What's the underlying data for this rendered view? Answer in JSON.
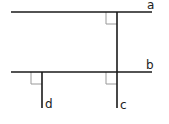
{
  "diagram": {
    "title": "",
    "colors": {
      "line": "#1a1a1a",
      "marker": "#999999"
    },
    "lines": [
      {
        "id": "a",
        "label": "a",
        "orientation": "horizontal",
        "x1": 11,
        "y1": 12,
        "x2": 152,
        "y2": 12
      },
      {
        "id": "b",
        "label": "b",
        "orientation": "horizontal",
        "x1": 11,
        "y1": 72,
        "x2": 152,
        "y2": 72
      },
      {
        "id": "c",
        "label": "c",
        "orientation": "vertical",
        "x1": 117,
        "y1": 12,
        "x2": 117,
        "y2": 108
      },
      {
        "id": "d",
        "label": "d",
        "orientation": "vertical",
        "x1": 42,
        "y1": 72,
        "x2": 42,
        "y2": 108
      }
    ],
    "labels": {
      "a": "a",
      "b": "b",
      "c": "c",
      "d": "d"
    },
    "right_angles": [
      {
        "at": "a∩c",
        "x": 106,
        "y": 12
      },
      {
        "at": "b∩d",
        "x": 31,
        "y": 72
      },
      {
        "at": "b∩c",
        "x": 106,
        "y": 72
      }
    ]
  }
}
